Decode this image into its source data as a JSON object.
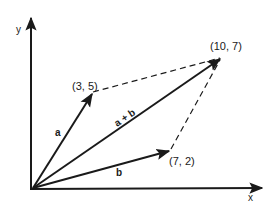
{
  "diagram": {
    "axes": {
      "x_label": "x",
      "y_label": "y"
    },
    "vectors": [
      {
        "name": "a",
        "label": "a",
        "from": [
          0,
          0
        ],
        "to": [
          3,
          5
        ],
        "point_label": "(3, 5)"
      },
      {
        "name": "b",
        "label": "b",
        "from": [
          0,
          0
        ],
        "to": [
          7,
          2
        ],
        "point_label": "(7, 2)"
      },
      {
        "name": "a_plus_b",
        "label": "a + b",
        "from": [
          0,
          0
        ],
        "to": [
          10,
          7
        ],
        "point_label": "(10, 7)"
      }
    ],
    "dashed_lines": [
      {
        "from": [
          3,
          5
        ],
        "to": [
          10,
          7
        ]
      },
      {
        "from": [
          7,
          2
        ],
        "to": [
          10,
          7
        ]
      }
    ],
    "colors": {
      "ink": "#1a1a1a",
      "background": "#ffffff"
    }
  }
}
